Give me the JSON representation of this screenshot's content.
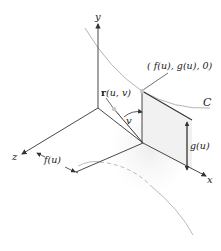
{
  "diagram": {
    "labels": {
      "y_axis": "y",
      "x_axis": "x",
      "z_axis": "z",
      "curve": "C",
      "point": "( f(u), g(u), 0)",
      "r_vector": "r",
      "r_args": "(u, v)",
      "angle": "v",
      "height": "g(u)",
      "distance": "f(u)"
    },
    "colors": {
      "axis": "#333333",
      "curve": "#b0b0b0",
      "surface_shade": "#ececec",
      "point": "#c8c8c8"
    }
  }
}
